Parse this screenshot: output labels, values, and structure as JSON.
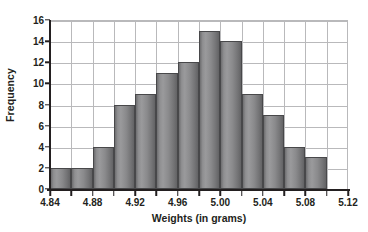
{
  "chart_data": {
    "type": "bar",
    "title": "",
    "subtitle": "",
    "xlabel": "Weights (in grams)",
    "ylabel": "Frequency",
    "categories": [
      "4.85",
      "4.87",
      "4.89",
      "4.91",
      "4.93",
      "4.95",
      "4.97",
      "4.99",
      "5.01",
      "5.03",
      "5.05",
      "5.07",
      "5.09"
    ],
    "bin_edges": [
      4.84,
      4.86,
      4.88,
      4.9,
      4.92,
      4.94,
      4.96,
      4.98,
      5.0,
      5.02,
      5.04,
      5.06,
      5.08,
      5.1
    ],
    "bin_width": 0.02,
    "values": [
      2,
      2,
      4,
      8,
      9,
      11,
      12,
      15,
      14,
      9,
      7,
      4,
      3
    ],
    "xlim": [
      4.84,
      5.12
    ],
    "ylim": [
      0,
      16
    ],
    "x_tick_labels": [
      "4.84",
      "4.88",
      "4.92",
      "4.96",
      "5.00",
      "5.04",
      "5.08",
      "5.12"
    ],
    "x_tick_values": [
      4.84,
      4.88,
      4.92,
      4.96,
      5.0,
      5.04,
      5.08,
      5.12
    ],
    "x_minor_tick_values": [
      4.86,
      4.9,
      4.94,
      4.98,
      5.02,
      5.06,
      5.1
    ],
    "y_tick_labels": [
      "0",
      "2",
      "4",
      "6",
      "8",
      "10",
      "12",
      "14",
      "16"
    ],
    "y_tick_values": [
      0,
      2,
      4,
      6,
      8,
      10,
      12,
      14,
      16
    ],
    "grid": true,
    "grid_color": "#b9b9bb",
    "legend": "none",
    "bar_fill_color": "#8f8f91",
    "bar_edge_color": "#48484a",
    "axis_color": "#231f20",
    "background_color": "#ffffff"
  }
}
